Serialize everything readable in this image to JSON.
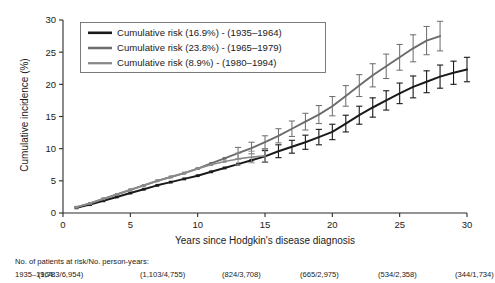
{
  "figure": {
    "background": "#ffffff",
    "axis_color": "#2b2b2b"
  },
  "chart_data": {
    "type": "line",
    "title": "",
    "subtitle": "",
    "xlabel": "Years since Hodgkin's disease diagnosis",
    "ylabel": "Cumulative incidence (%)",
    "xlim": [
      0,
      30
    ],
    "ylim": [
      0,
      30
    ],
    "xticks": [
      0,
      5,
      10,
      15,
      20,
      25,
      30
    ],
    "yticks": [
      0,
      5,
      10,
      15,
      20,
      25,
      30
    ],
    "grid": false,
    "legend_position": "top-left",
    "error_bars": "95% confidence interval (vertical caps)",
    "series": [
      {
        "name": "Cumulative risk (16.9%) - (1935–1964)",
        "color": "#1a1a1a",
        "width": 2.0,
        "final_value": 16.9,
        "x": [
          1,
          2,
          3,
          4,
          5,
          6,
          7,
          8,
          9,
          10,
          11,
          12,
          13,
          14,
          15,
          16,
          17,
          18,
          19,
          20,
          21,
          22,
          23,
          24,
          25,
          26,
          27,
          28,
          29,
          30
        ],
        "y": [
          0.8,
          1.3,
          1.9,
          2.5,
          3.1,
          3.7,
          4.3,
          4.8,
          5.3,
          5.8,
          6.4,
          7.0,
          7.6,
          8.2,
          8.8,
          9.6,
          10.3,
          11.0,
          11.8,
          12.6,
          13.9,
          15.2,
          16.4,
          17.5,
          18.6,
          19.6,
          20.4,
          21.2,
          21.8,
          22.3
        ],
        "err": [
          0.0,
          0.0,
          0.0,
          0.0,
          0.0,
          0.0,
          0.0,
          0.0,
          0.0,
          0.0,
          0.0,
          0.0,
          0.0,
          0.0,
          0.9,
          1.0,
          1.0,
          1.1,
          1.2,
          1.2,
          1.3,
          1.4,
          1.5,
          1.5,
          1.6,
          1.7,
          1.7,
          1.8,
          1.8,
          1.9
        ]
      },
      {
        "name": "Cumulative risk (23.8%) - (1965–1979)",
        "color": "#6b6b6b",
        "width": 1.9,
        "final_value": 23.8,
        "x": [
          1,
          2,
          3,
          4,
          5,
          6,
          7,
          8,
          9,
          10,
          11,
          12,
          13,
          14,
          15,
          16,
          17,
          18,
          19,
          20,
          21,
          22,
          23,
          24,
          25,
          26,
          27,
          28
        ],
        "y": [
          0.9,
          1.5,
          2.2,
          2.9,
          3.6,
          4.3,
          5.0,
          5.6,
          6.2,
          6.9,
          7.7,
          8.5,
          9.3,
          10.1,
          11.0,
          12.0,
          13.1,
          14.2,
          15.3,
          16.6,
          18.2,
          19.8,
          21.4,
          22.8,
          24.2,
          25.6,
          26.8,
          27.5
        ],
        "err": [
          0.0,
          0.0,
          0.0,
          0.0,
          0.0,
          0.0,
          0.0,
          0.0,
          0.0,
          0.0,
          0.0,
          0.0,
          0.9,
          0.9,
          1.0,
          1.1,
          1.2,
          1.3,
          1.4,
          1.5,
          1.6,
          1.7,
          1.8,
          1.9,
          2.0,
          2.1,
          2.2,
          2.3
        ]
      },
      {
        "name": "Cumulative risk (8.9%) - (1980–1994)",
        "color": "#8a8a8a",
        "width": 1.7,
        "final_value": 8.9,
        "x": [
          1,
          2,
          3,
          4,
          5,
          6,
          7,
          8,
          9,
          10,
          11,
          12,
          13,
          14,
          15
        ],
        "y": [
          0.9,
          1.5,
          2.2,
          2.9,
          3.6,
          4.3,
          5.0,
          5.6,
          6.2,
          6.9,
          7.5,
          8.0,
          8.4,
          8.7,
          8.9
        ],
        "err": [
          0.0,
          0.0,
          0.0,
          0.0,
          0.0,
          0.0,
          0.0,
          0.0,
          0.0,
          0.0,
          0.0,
          0.0,
          0.9,
          0.9,
          1.0
        ]
      }
    ]
  },
  "legend": {
    "entries": [
      {
        "label": "Cumulative risk (16.9%) - (1935–1964)"
      },
      {
        "label": "Cumulative risk (23.8%) - (1965–1979)"
      },
      {
        "label": "Cumulative risk (8.9%) - (1980–1994)"
      }
    ]
  },
  "risk_table": {
    "header": "No. of patients at risk/No. person-years:",
    "rows": [
      {
        "label": "1935–1964:",
        "cells": [
          "(1,783/6,954)",
          "(1,103/4,755)",
          "(824/3,708)",
          "(665/2,975)",
          "(534/2,358)",
          "(344/1,734)"
        ]
      }
    ]
  },
  "ticks": {
    "x": [
      "0",
      "5",
      "10",
      "15",
      "20",
      "25",
      "30"
    ],
    "y": [
      "0",
      "5",
      "10",
      "15",
      "20",
      "25",
      "30"
    ]
  }
}
